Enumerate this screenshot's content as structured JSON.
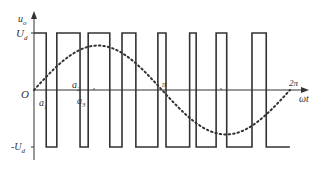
{
  "diagram": {
    "colors": {
      "stroke": "#333333",
      "background": "#ffffff"
    },
    "y_axis_label": "u",
    "y_axis_label_sub": "o",
    "x_axis_label": "ωt",
    "origin_label": "O",
    "top_level_label": "U",
    "top_level_sub": "d",
    "bottom_level_label": "-U",
    "bottom_level_sub": "d",
    "pi_label": "π",
    "two_pi_label": "2π",
    "angle_labels": [
      {
        "text": "a",
        "sub": "1"
      },
      {
        "text": "a",
        "sub": "2"
      },
      {
        "text": "a",
        "sub": "3"
      }
    ],
    "levels": {
      "high": 1,
      "low": -1
    },
    "pulse_edges_rad": [
      0.0,
      0.3,
      0.56,
      1.13,
      1.33,
      1.86,
      2.16,
      2.5,
      3.04,
      3.24,
      3.82,
      3.98,
      4.47,
      4.73,
      5.35,
      5.7,
      6.28
    ],
    "reference_wave": {
      "type": "sine",
      "style": "dotted",
      "amplitude": 0.78
    }
  }
}
